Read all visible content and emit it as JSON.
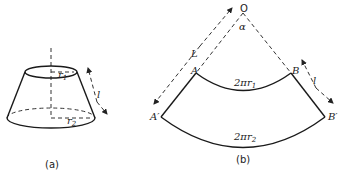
{
  "figure_a": {
    "caption": "(a)",
    "labels": {
      "r1": "r",
      "r1_sub": "1",
      "r2": "r",
      "r2_sub": "2",
      "slant": "l"
    }
  },
  "figure_b": {
    "caption": "(b)",
    "labels": {
      "apex": "O",
      "angle": "α",
      "long_edge": "L",
      "A": "A",
      "B": "B",
      "A_prime": "A′",
      "B_prime": "B′",
      "slant": "l",
      "inner_arc": "2πr",
      "inner_arc_sub": "1",
      "outer_arc": "2πr",
      "outer_arc_sub": "2"
    }
  }
}
